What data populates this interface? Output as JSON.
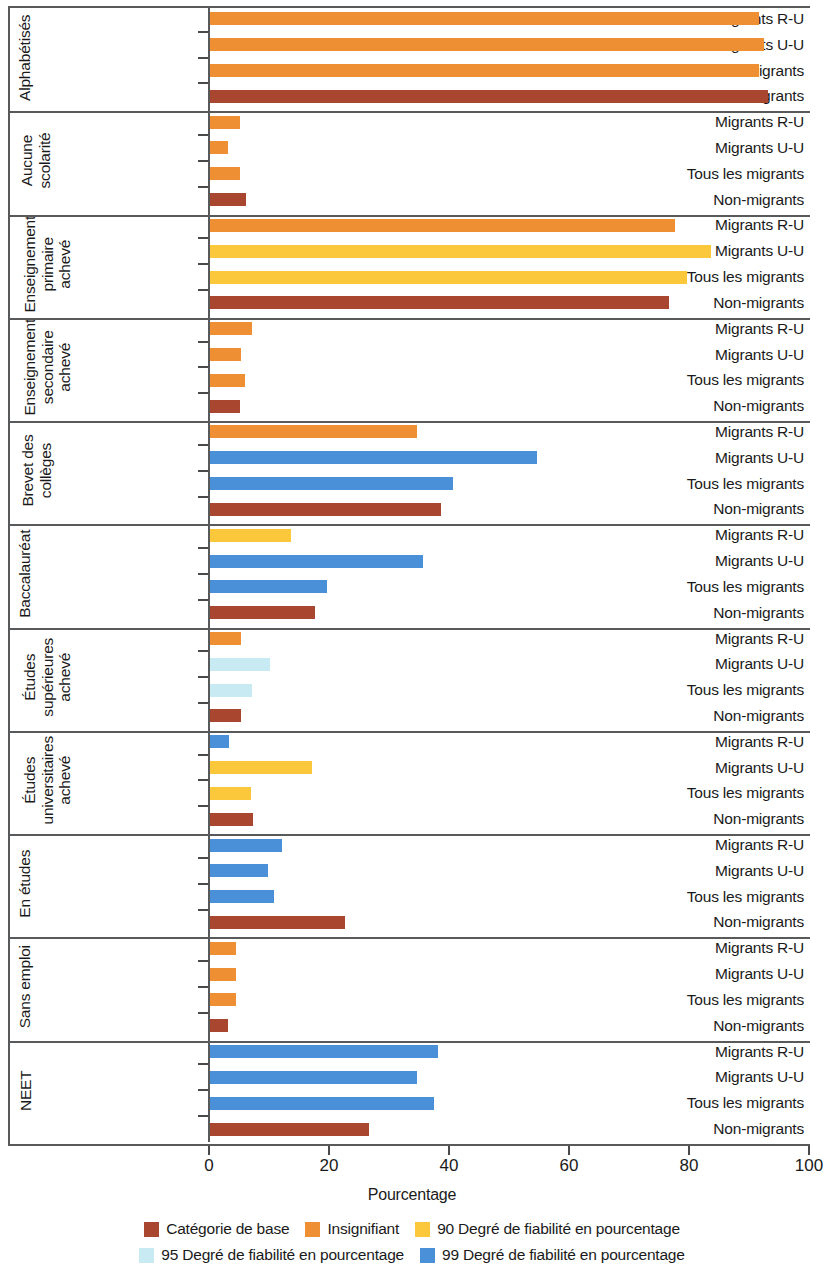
{
  "chart_data": {
    "type": "bar",
    "orientation": "horizontal",
    "title": "",
    "xlabel": "Pourcentage",
    "ylabel": "",
    "xlim": [
      0,
      100
    ],
    "xticks": [
      0,
      20,
      40,
      60,
      80,
      100
    ],
    "grid": false,
    "legend_position": "bottom",
    "series_labels": [
      "Migrants R-U",
      "Migrants U-U",
      "Tous les migrants",
      "Non-migrants"
    ],
    "color_key": {
      "base": "#a9462f",
      "insignifiant": "#ef8f33",
      "conf90": "#fbc githubusercontent"
    },
    "colors": {
      "base": "#a9462f",
      "insignifiant": "#ef8f33",
      "conf90": "#fbc83c",
      "conf95": "#c8eaf3",
      "conf99": "#4a90d9"
    },
    "legend": [
      {
        "label": "Catégorie de base",
        "color": "#a9462f"
      },
      {
        "label": "Insignifiant",
        "color": "#ef8f33"
      },
      {
        "label": "90 Degré de fiabilité en pourcentage",
        "color": "#fbc83c"
      },
      {
        "label": "95 Degré de fiabilité en pourcentage",
        "color": "#c8eaf3"
      },
      {
        "label": "99 Degré de fiabilité en pourcentage",
        "color": "#4a90d9"
      }
    ],
    "groups": [
      {
        "name": "Alphabétisés",
        "lines": [
          "Alphabétisés"
        ],
        "rows": [
          {
            "label": "Migrants R-U",
            "value": 91.5,
            "color": "#ef8f33"
          },
          {
            "label": "Migrants U-U",
            "value": 92.3,
            "color": "#ef8f33"
          },
          {
            "label": "Tous les migrants",
            "value": 91.5,
            "color": "#ef8f33"
          },
          {
            "label": "Non-migrants",
            "value": 93.0,
            "color": "#a9462f"
          }
        ]
      },
      {
        "name": "Aucune scolarité",
        "lines": [
          "Aucune",
          "scolarité"
        ],
        "rows": [
          {
            "label": "Migrants R-U",
            "value": 5.0,
            "color": "#ef8f33"
          },
          {
            "label": "Migrants U-U",
            "value": 3.0,
            "color": "#ef8f33"
          },
          {
            "label": "Tous les migrants",
            "value": 5.0,
            "color": "#ef8f33"
          },
          {
            "label": "Non-migrants",
            "value": 6.0,
            "color": "#a9462f"
          }
        ]
      },
      {
        "name": "Enseignement primaire achevé",
        "lines": [
          "Enseignement",
          "primaire",
          "achevé"
        ],
        "rows": [
          {
            "label": "Migrants R-U",
            "value": 77.5,
            "color": "#ef8f33"
          },
          {
            "label": "Migrants U-U",
            "value": 83.5,
            "color": "#fbc83c"
          },
          {
            "label": "Tous les migrants",
            "value": 79.5,
            "color": "#fbc83c"
          },
          {
            "label": "Non-migrants",
            "value": 76.5,
            "color": "#a9462f"
          }
        ]
      },
      {
        "name": "Enseignement secondaire achevé",
        "lines": [
          "Enseignement",
          "secondaire",
          "achevé"
        ],
        "rows": [
          {
            "label": "Migrants R-U",
            "value": 7.0,
            "color": "#ef8f33"
          },
          {
            "label": "Migrants U-U",
            "value": 5.2,
            "color": "#ef8f33"
          },
          {
            "label": "Tous les migrants",
            "value": 5.9,
            "color": "#ef8f33"
          },
          {
            "label": "Non-migrants",
            "value": 5.0,
            "color": "#a9462f"
          }
        ]
      },
      {
        "name": "Brevet des collèges",
        "lines": [
          "Brevet des",
          "collèges"
        ],
        "rows": [
          {
            "label": "Migrants R-U",
            "value": 34.5,
            "color": "#ef8f33"
          },
          {
            "label": "Migrants U-U",
            "value": 54.5,
            "color": "#4a90d9"
          },
          {
            "label": "Tous les migrants",
            "value": 40.5,
            "color": "#4a90d9"
          },
          {
            "label": "Non-migrants",
            "value": 38.5,
            "color": "#a9462f"
          }
        ]
      },
      {
        "name": "Baccalauréat",
        "lines": [
          "Baccalauréat"
        ],
        "rows": [
          {
            "label": "Migrants R-U",
            "value": 13.5,
            "color": "#fbc83c"
          },
          {
            "label": "Migrants U-U",
            "value": 35.5,
            "color": "#4a90d9"
          },
          {
            "label": "Tous les migrants",
            "value": 19.5,
            "color": "#4a90d9"
          },
          {
            "label": "Non-migrants",
            "value": 17.5,
            "color": "#a9462f"
          }
        ]
      },
      {
        "name": "Études supérieures achevé",
        "lines": [
          "Études",
          "supérieures",
          "achevé"
        ],
        "rows": [
          {
            "label": "Migrants R-U",
            "value": 5.2,
            "color": "#ef8f33"
          },
          {
            "label": "Migrants U-U",
            "value": 10.0,
            "color": "#c8eaf3"
          },
          {
            "label": "Tous les migrants",
            "value": 7.0,
            "color": "#c8eaf3"
          },
          {
            "label": "Non-migrants",
            "value": 5.2,
            "color": "#a9462f"
          }
        ]
      },
      {
        "name": "Études universitaires achevé",
        "lines": [
          "Études",
          "universitaires",
          "achevé"
        ],
        "rows": [
          {
            "label": "Migrants R-U",
            "value": 3.2,
            "color": "#4a90d9"
          },
          {
            "label": "Migrants U-U",
            "value": 17.0,
            "color": "#fbc83c"
          },
          {
            "label": "Tous les migrants",
            "value": 6.8,
            "color": "#fbc83c"
          },
          {
            "label": "Non-migrants",
            "value": 7.2,
            "color": "#a9462f"
          }
        ]
      },
      {
        "name": "En études",
        "lines": [
          "En études"
        ],
        "rows": [
          {
            "label": "Migrants R-U",
            "value": 12.0,
            "color": "#4a90d9"
          },
          {
            "label": "Migrants U-U",
            "value": 9.7,
            "color": "#4a90d9"
          },
          {
            "label": "Tous les migrants",
            "value": 10.7,
            "color": "#4a90d9"
          },
          {
            "label": "Non-migrants",
            "value": 22.5,
            "color": "#a9462f"
          }
        ]
      },
      {
        "name": "Sans emploi",
        "lines": [
          "Sans emploi"
        ],
        "rows": [
          {
            "label": "Migrants R-U",
            "value": 4.3,
            "color": "#ef8f33"
          },
          {
            "label": "Migrants U-U",
            "value": 4.3,
            "color": "#ef8f33"
          },
          {
            "label": "Tous les migrants",
            "value": 4.3,
            "color": "#ef8f33"
          },
          {
            "label": "Non-migrants",
            "value": 3.0,
            "color": "#a9462f"
          }
        ]
      },
      {
        "name": "NEET",
        "lines": [
          "NEET"
        ],
        "rows": [
          {
            "label": "Migrants R-U",
            "value": 38.0,
            "color": "#4a90d9"
          },
          {
            "label": "Migrants U-U",
            "value": 34.5,
            "color": "#4a90d9"
          },
          {
            "label": "Tous les migrants",
            "value": 37.3,
            "color": "#4a90d9"
          },
          {
            "label": "Non-migrants",
            "value": 26.5,
            "color": "#a9462f"
          }
        ]
      }
    ]
  }
}
